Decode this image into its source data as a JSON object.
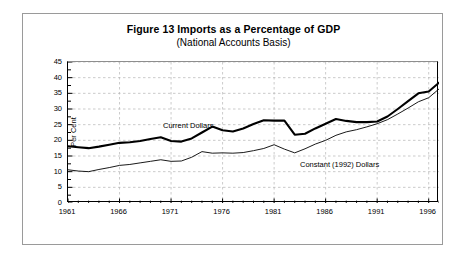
{
  "figure": {
    "title": "Figure 13 Imports as a Percentage of GDP",
    "subtitle": "(National Accounts Basis)"
  },
  "chart_data": {
    "type": "line",
    "title": "Figure 13 Imports as a Percentage of GDP",
    "subtitle": "(National Accounts Basis)",
    "xlabel": "",
    "ylabel": "Per Cent",
    "xlim": [
      1961,
      1997
    ],
    "ylim": [
      0,
      45
    ],
    "ytick_step": 5,
    "yticks": [
      0,
      5,
      10,
      15,
      20,
      25,
      30,
      35,
      40,
      45
    ],
    "xticks": [
      1961,
      1966,
      1971,
      1976,
      1981,
      1986,
      1991,
      1996
    ],
    "xtick_labels": [
      "1961",
      "1966",
      "1971",
      "1976",
      "1981",
      "1986",
      "1991",
      "1996"
    ],
    "minor_xtick_interval": 1,
    "grid": true,
    "grid_style": "dashed",
    "grid_color": "#b5b5b5",
    "legend_position": "inline-annotation",
    "x": [
      1961,
      1962,
      1963,
      1964,
      1965,
      1966,
      1967,
      1968,
      1969,
      1970,
      1971,
      1972,
      1973,
      1974,
      1975,
      1976,
      1977,
      1978,
      1979,
      1980,
      1981,
      1982,
      1983,
      1984,
      1985,
      1986,
      1987,
      1988,
      1989,
      1990,
      1991,
      1992,
      1993,
      1994,
      1995,
      1996,
      1997
    ],
    "series": [
      {
        "name": "Current Dollars",
        "color": "#000000",
        "line_width": 2.1,
        "values": [
          18.1,
          17.8,
          17.5,
          18.0,
          18.6,
          19.2,
          19.4,
          19.8,
          20.4,
          21.0,
          19.8,
          19.6,
          20.6,
          22.5,
          24.4,
          23.2,
          22.8,
          23.8,
          25.2,
          26.4,
          26.3,
          26.3,
          21.8,
          22.1,
          23.8,
          25.3,
          26.8,
          26.2,
          25.8,
          25.8,
          26.0,
          27.6,
          30.0,
          32.5,
          35.0,
          35.6,
          38.4
        ]
      },
      {
        "name": "Constant (1992) Dollars",
        "color": "#000000",
        "line_width": 0.9,
        "values": [
          10.6,
          10.2,
          10.0,
          10.7,
          11.3,
          12.0,
          12.3,
          12.8,
          13.3,
          13.8,
          13.3,
          13.4,
          14.6,
          16.4,
          15.9,
          16.0,
          15.9,
          16.1,
          16.7,
          17.4,
          18.6,
          17.2,
          16.0,
          17.3,
          18.8,
          20.0,
          21.6,
          22.7,
          23.4,
          24.3,
          25.3,
          26.6,
          28.4,
          30.3,
          32.3,
          33.6,
          36.4
        ]
      }
    ],
    "annotations": [
      {
        "text": "Current Dollars",
        "near_x": 1969,
        "near_y": 27
      },
      {
        "text": "Constant (1992) Dollars",
        "near_x": 1986,
        "near_y": 16
      }
    ]
  }
}
